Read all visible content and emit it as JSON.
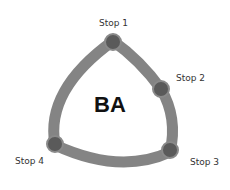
{
  "diagram": {
    "center_label": "BA",
    "route_color": "#7d7d7d",
    "stop_color": "#5a5a5a",
    "stops": [
      {
        "label": "Stop 1"
      },
      {
        "label": "Stop 2"
      },
      {
        "label": "Stop 3"
      },
      {
        "label": "Stop 4"
      }
    ]
  }
}
